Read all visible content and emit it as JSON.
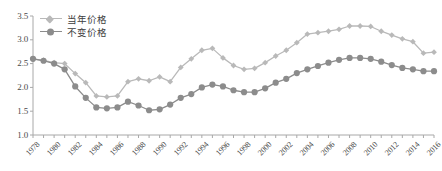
{
  "chart_data": {
    "type": "line",
    "title": "",
    "xlabel": "",
    "ylabel": "",
    "ylim": [
      1.0,
      3.5
    ],
    "ytick_step": 0.5,
    "yticks": [
      "1.0",
      "1.5",
      "2.0",
      "2.5",
      "3.0",
      "3.5"
    ],
    "grid": false,
    "legend_position": "top-left",
    "x": [
      1978,
      1979,
      1980,
      1981,
      1982,
      1983,
      1984,
      1985,
      1986,
      1987,
      1988,
      1989,
      1990,
      1991,
      1992,
      1993,
      1994,
      1995,
      1996,
      1997,
      1998,
      1999,
      2000,
      2001,
      2002,
      2003,
      2004,
      2005,
      2006,
      2007,
      2008,
      2009,
      2010,
      2011,
      2012,
      2013,
      2014,
      2015,
      2016
    ],
    "xtick_labels": [
      "1978",
      "1980",
      "1982",
      "1984",
      "1986",
      "1988",
      "1990",
      "1992",
      "1994",
      "1996",
      "1998",
      "2000",
      "2002",
      "2004",
      "2006",
      "2008",
      "2010",
      "2012",
      "2014",
      "2016"
    ],
    "series": [
      {
        "name": "当年价格",
        "color": "#b9b9b9",
        "marker": "diamond",
        "values": [
          2.6,
          2.57,
          2.52,
          2.5,
          2.29,
          2.1,
          1.82,
          1.8,
          1.82,
          2.12,
          2.18,
          2.14,
          2.22,
          2.12,
          2.42,
          2.6,
          2.78,
          2.82,
          2.62,
          2.46,
          2.38,
          2.4,
          2.52,
          2.66,
          2.78,
          2.94,
          3.12,
          3.15,
          3.18,
          3.22,
          3.29,
          3.29,
          3.28,
          3.18,
          3.1,
          3.02,
          2.96,
          2.72,
          2.74
        ]
      },
      {
        "name": "不变价格",
        "color": "#8c8c8c",
        "marker": "circle",
        "values": [
          2.6,
          2.56,
          2.5,
          2.38,
          2.02,
          1.78,
          1.58,
          1.56,
          1.58,
          1.7,
          1.62,
          1.52,
          1.54,
          1.64,
          1.78,
          1.86,
          2.0,
          2.06,
          2.02,
          1.94,
          1.9,
          1.9,
          1.98,
          2.1,
          2.18,
          2.3,
          2.38,
          2.45,
          2.52,
          2.58,
          2.62,
          2.62,
          2.6,
          2.54,
          2.47,
          2.41,
          2.38,
          2.34,
          2.34
        ]
      }
    ]
  },
  "legend": {
    "items": [
      {
        "label": "当年价格"
      },
      {
        "label": "不变价格"
      }
    ]
  }
}
